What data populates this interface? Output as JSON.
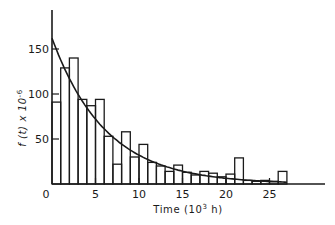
{
  "chart_data": {
    "type": "bar",
    "subtype": "histogram_with_fitted_curve",
    "title": "",
    "xlabel": "Time (10^3 h)",
    "xlabel_parts": {
      "base": "Time (10",
      "sup": "3",
      "tail": " h)"
    },
    "ylabel": "f(t) x 10^-6",
    "ylabel_parts": {
      "base": "f (t) x 10",
      "sup": "-6"
    },
    "xlim": [
      0,
      32
    ],
    "ylim": [
      0,
      190
    ],
    "x_ticks": [
      0,
      5,
      10,
      15,
      20,
      25
    ],
    "y_ticks": [
      50,
      100,
      150
    ],
    "grid": false,
    "legend": null,
    "bin_width": 1,
    "bins": [
      {
        "x0": 0,
        "x1": 1,
        "value": 91
      },
      {
        "x0": 1,
        "x1": 2,
        "value": 129
      },
      {
        "x0": 2,
        "x1": 3,
        "value": 140
      },
      {
        "x0": 3,
        "x1": 4,
        "value": 94
      },
      {
        "x0": 4,
        "x1": 5,
        "value": 87
      },
      {
        "x0": 5,
        "x1": 6,
        "value": 94
      },
      {
        "x0": 6,
        "x1": 7,
        "value": 53
      },
      {
        "x0": 7,
        "x1": 8,
        "value": 22
      },
      {
        "x0": 8,
        "x1": 9,
        "value": 58
      },
      {
        "x0": 9,
        "x1": 10,
        "value": 30
      },
      {
        "x0": 10,
        "x1": 11,
        "value": 44
      },
      {
        "x0": 11,
        "x1": 12,
        "value": 24
      },
      {
        "x0": 12,
        "x1": 13,
        "value": 20
      },
      {
        "x0": 13,
        "x1": 14,
        "value": 14
      },
      {
        "x0": 14,
        "x1": 15,
        "value": 21
      },
      {
        "x0": 15,
        "x1": 16,
        "value": 13
      },
      {
        "x0": 16,
        "x1": 17,
        "value": 10
      },
      {
        "x0": 17,
        "x1": 18,
        "value": 14
      },
      {
        "x0": 18,
        "x1": 19,
        "value": 12
      },
      {
        "x0": 19,
        "x1": 20,
        "value": 8
      },
      {
        "x0": 20,
        "x1": 21,
        "value": 11
      },
      {
        "x0": 21,
        "x1": 22,
        "value": 29
      },
      {
        "x0": 22,
        "x1": 23,
        "value": 4
      },
      {
        "x0": 23,
        "x1": 24,
        "value": 3
      },
      {
        "x0": 24,
        "x1": 25,
        "value": 4
      },
      {
        "x0": 25,
        "x1": 26,
        "value": 3
      },
      {
        "x0": 26,
        "x1": 27,
        "value": 14
      }
    ],
    "fitted_curve": {
      "type": "exponential",
      "a": 162,
      "lambda": 0.162,
      "x_range": [
        0,
        27
      ],
      "samples": [
        {
          "x": 0,
          "y": 162
        },
        {
          "x": 5,
          "y": 72
        },
        {
          "x": 10,
          "y": 32
        },
        {
          "x": 15,
          "y": 14
        },
        {
          "x": 20,
          "y": 6
        },
        {
          "x": 27,
          "y": 2
        }
      ]
    }
  },
  "style": {
    "ink": "#1a1a1a",
    "background": "#ffffff"
  }
}
